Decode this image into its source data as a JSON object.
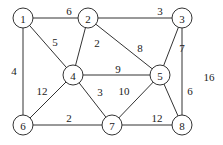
{
  "graph": {
    "nodes": [
      {
        "id": "1",
        "x": 23,
        "y": 18
      },
      {
        "id": "2",
        "x": 88,
        "y": 18
      },
      {
        "id": "3",
        "x": 182,
        "y": 18
      },
      {
        "id": "4",
        "x": 73,
        "y": 75
      },
      {
        "id": "5",
        "x": 160,
        "y": 75
      },
      {
        "id": "6",
        "x": 23,
        "y": 125
      },
      {
        "id": "7",
        "x": 112,
        "y": 125
      },
      {
        "id": "8",
        "x": 182,
        "y": 125
      }
    ],
    "edges": [
      {
        "from": "1",
        "to": "2",
        "weight": "6",
        "lx": 69,
        "ly": 11
      },
      {
        "from": "2",
        "to": "3",
        "weight": "3",
        "lx": 160,
        "ly": 11
      },
      {
        "from": "1",
        "to": "6",
        "weight": "4",
        "lx": 14,
        "ly": 71
      },
      {
        "from": "1",
        "to": "4",
        "weight": "5",
        "lx": 55,
        "ly": 42
      },
      {
        "from": "2",
        "to": "4",
        "weight": "2",
        "lx": 97,
        "ly": 43
      },
      {
        "from": "2",
        "to": "5",
        "weight": "8",
        "lx": 140,
        "ly": 48
      },
      {
        "from": "3",
        "to": "5",
        "weight": "7",
        "lx": 182,
        "ly": 48
      },
      {
        "from": "3",
        "to": "8",
        "weight": "16",
        "lx": 209,
        "ly": 77
      },
      {
        "from": "4",
        "to": "5",
        "weight": "9",
        "lx": 118,
        "ly": 69
      },
      {
        "from": "4",
        "to": "6",
        "weight": "12",
        "lx": 42,
        "ly": 91
      },
      {
        "from": "4",
        "to": "7",
        "weight": "3",
        "lx": 100,
        "ly": 92
      },
      {
        "from": "5",
        "to": "7",
        "weight": "10",
        "lx": 124,
        "ly": 91
      },
      {
        "from": "5",
        "to": "8",
        "weight": "6",
        "lx": 190,
        "ly": 91
      },
      {
        "from": "6",
        "to": "7",
        "weight": "2",
        "lx": 69,
        "ly": 118
      },
      {
        "from": "7",
        "to": "8",
        "weight": "12",
        "lx": 157,
        "ly": 118
      }
    ]
  }
}
